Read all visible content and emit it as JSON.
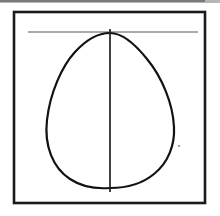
{
  "figure": {
    "canvas": {
      "width": 220,
      "height": 216
    },
    "background_color": "#ffffff",
    "title": "",
    "caption": ""
  },
  "frame": {
    "name": "rectangular-border",
    "x": 14,
    "y": 12,
    "width": 191,
    "height": 191,
    "stroke_color": "#1a1a1a",
    "stroke_width": 2.6,
    "fill": "none"
  },
  "scan_artifact": {
    "name": "top-scan-band",
    "x": 0,
    "y": 0,
    "width": 220,
    "height": 3,
    "color": "#7a7a7a"
  },
  "horizontal_line": {
    "name": "tangent-line",
    "x1": 28,
    "y1": 32,
    "x2": 198,
    "y2": 32,
    "stroke_color": "#55555f",
    "stroke_width": 1.1
  },
  "vertical_line": {
    "name": "axis-line",
    "x1": 110,
    "y1": 29,
    "x2": 110,
    "y2": 192,
    "stroke_color": "#1f1f1f",
    "stroke_width": 1.7
  },
  "egg_outline": {
    "name": "egg-curve",
    "stroke_color": "#121212",
    "stroke_width": 2.2,
    "fill": "none",
    "path": "M 110 33 C 98 33 86 40 75 52 C 62 66 50 93 47 120 C 44 146 53 168 70 179 C 82 187 97 189 110 188 C 125 188 142 184 154 174 C 168 163 175 145 174 127 C 173 104 162 77 147 59 C 135 44 122 33 110 33 Z",
    "apex_point": {
      "x": 110,
      "y": 33
    },
    "leftmost_point": {
      "x": 46,
      "y": 125
    },
    "rightmost_point": {
      "x": 174,
      "y": 128
    },
    "bottom_point": {
      "x": 110,
      "y": 188
    }
  },
  "speck": {
    "name": "dust-speck-artifact",
    "cx": 179,
    "cy": 146,
    "r": 1.1,
    "color": "#8c8c8c"
  }
}
